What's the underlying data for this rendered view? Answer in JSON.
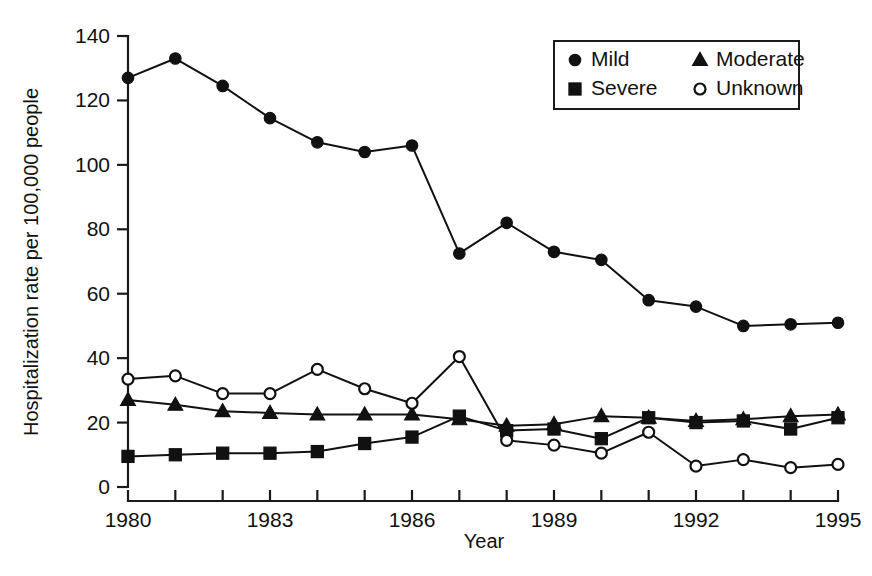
{
  "chart_data": {
    "type": "line",
    "title": "",
    "xlabel": "Year",
    "ylabel": "Hospitalization rate per 100,000 people",
    "xlim": [
      1980,
      1995
    ],
    "ylim": [
      0,
      140
    ],
    "ytick_step": 20,
    "yticks": [
      0,
      20,
      40,
      60,
      80,
      100,
      120,
      140
    ],
    "ytick_labels": [
      "0",
      "20",
      "40",
      "60",
      "80",
      "100",
      "120",
      "140"
    ],
    "xticks": [
      1980,
      1981,
      1982,
      1983,
      1984,
      1985,
      1986,
      1987,
      1988,
      1989,
      1990,
      1991,
      1992,
      1993,
      1994,
      1995
    ],
    "xtick_labels_shown": [
      "1980",
      "1983",
      "1986",
      "1989",
      "1992",
      "1995"
    ],
    "xtick_label_years": [
      1980,
      1983,
      1986,
      1989,
      1992,
      1995
    ],
    "grid": false,
    "legend_position": "top-right",
    "x": [
      1980,
      1981,
      1982,
      1983,
      1984,
      1985,
      1986,
      1987,
      1988,
      1989,
      1990,
      1991,
      1992,
      1993,
      1994,
      1995
    ],
    "series": [
      {
        "name": "Mild",
        "marker": "filled-circle",
        "values": [
          127,
          133,
          124.5,
          114.5,
          107,
          104,
          106,
          72.5,
          82,
          73,
          70.5,
          58,
          56,
          50,
          50.5,
          51
        ]
      },
      {
        "name": "Moderate",
        "marker": "filled-triangle",
        "values": [
          27,
          25.5,
          23.5,
          23,
          22.5,
          22.5,
          22.5,
          21,
          19,
          19.5,
          22,
          21.5,
          20.5,
          21,
          22,
          22.5
        ]
      },
      {
        "name": "Severe",
        "marker": "filled-square",
        "values": [
          9.5,
          10,
          10.5,
          10.5,
          11,
          13.5,
          15.5,
          22,
          17.5,
          18,
          15,
          21.5,
          20,
          20.5,
          18,
          21.5
        ]
      },
      {
        "name": "Unknown",
        "marker": "open-circle",
        "values": [
          33.5,
          34.5,
          29,
          29,
          36.5,
          30.5,
          26,
          40.5,
          14.5,
          13,
          10.5,
          17,
          6.5,
          8.5,
          6,
          7
        ]
      }
    ]
  },
  "legend": {
    "entries": [
      {
        "label": "Mild",
        "marker": "filled-circle"
      },
      {
        "label": "Moderate",
        "marker": "filled-triangle"
      },
      {
        "label": "Severe",
        "marker": "filled-square"
      },
      {
        "label": "Unknown",
        "marker": "open-circle"
      }
    ]
  },
  "colors": {
    "ink": "#111111",
    "background": "#ffffff"
  }
}
